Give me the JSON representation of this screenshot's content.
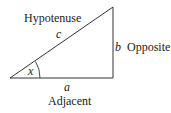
{
  "diagram": {
    "type": "right-triangle",
    "labels": {
      "hypotenuse": "Hypotenuse",
      "opposite": "Opposite",
      "adjacent": "Adjacent"
    },
    "variables": {
      "hypotenuse": "c",
      "opposite": "b",
      "adjacent": "a",
      "angle": "x"
    },
    "colors": {
      "line": "#333333",
      "text": "#222222"
    }
  }
}
